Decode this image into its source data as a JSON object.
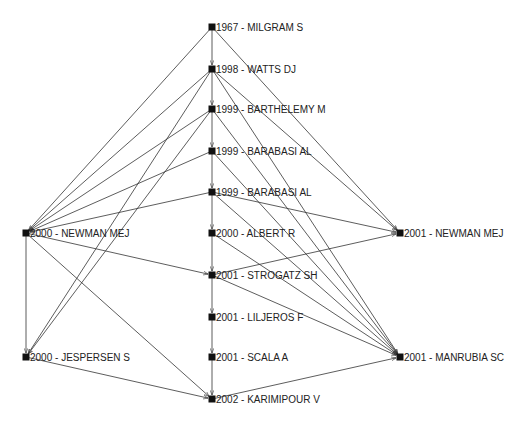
{
  "diagram": {
    "type": "citation-network",
    "colors": {
      "edge": "#333333",
      "node": "#111111",
      "label": "#222222",
      "background": "#ffffff"
    },
    "nodes": [
      {
        "id": "milgram",
        "label": "1967 - MILGRAM S",
        "x": 212,
        "y": 27
      },
      {
        "id": "watts",
        "label": "1998 - WATTS DJ",
        "x": 212,
        "y": 69
      },
      {
        "id": "barthelemy",
        "label": "1999 - BARTHELEMY M",
        "x": 212,
        "y": 109
      },
      {
        "id": "barabasi1",
        "label": "1999 - BARABASI AL",
        "x": 212,
        "y": 151
      },
      {
        "id": "barabasi2",
        "label": "1999 - BARABASI AL",
        "x": 212,
        "y": 192
      },
      {
        "id": "albert",
        "label": "2000 - ALBERT R",
        "x": 212,
        "y": 233
      },
      {
        "id": "strogatz",
        "label": "2001 - STROGATZ SH",
        "x": 212,
        "y": 275
      },
      {
        "id": "liljeros",
        "label": "2001 - LILJEROS F",
        "x": 212,
        "y": 317
      },
      {
        "id": "scala",
        "label": "2001 - SCALA A",
        "x": 212,
        "y": 357
      },
      {
        "id": "karimipour",
        "label": "2002 - KARIMIPOUR V",
        "x": 212,
        "y": 399
      },
      {
        "id": "newman2000",
        "label": "2000 - NEWMAN MEJ",
        "x": 26,
        "y": 233
      },
      {
        "id": "jespersen",
        "label": "2000 - JESPERSEN S",
        "x": 26,
        "y": 357
      },
      {
        "id": "newman2001",
        "label": "2001 - NEWMAN MEJ",
        "x": 400,
        "y": 233
      },
      {
        "id": "manrubia",
        "label": "2001 - MANRUBIA SC",
        "x": 400,
        "y": 357
      }
    ],
    "edges": [
      [
        "milgram",
        "watts"
      ],
      [
        "watts",
        "barthelemy"
      ],
      [
        "barthelemy",
        "barabasi1"
      ],
      [
        "barabasi1",
        "barabasi2"
      ],
      [
        "barabasi2",
        "albert"
      ],
      [
        "albert",
        "strogatz"
      ],
      [
        "strogatz",
        "liljeros"
      ],
      [
        "liljeros",
        "scala"
      ],
      [
        "scala",
        "karimipour"
      ],
      [
        "milgram",
        "newman2000"
      ],
      [
        "milgram",
        "newman2001"
      ],
      [
        "watts",
        "newman2000"
      ],
      [
        "watts",
        "jespersen"
      ],
      [
        "watts",
        "newman2001"
      ],
      [
        "watts",
        "manrubia"
      ],
      [
        "barthelemy",
        "newman2000"
      ],
      [
        "barthelemy",
        "jespersen"
      ],
      [
        "barthelemy",
        "manrubia"
      ],
      [
        "barabasi1",
        "newman2000"
      ],
      [
        "barabasi1",
        "manrubia"
      ],
      [
        "barabasi2",
        "newman2000"
      ],
      [
        "barabasi2",
        "newman2001"
      ],
      [
        "barabasi2",
        "manrubia"
      ],
      [
        "albert",
        "manrubia"
      ],
      [
        "newman2000",
        "strogatz"
      ],
      [
        "newman2000",
        "jespersen"
      ],
      [
        "newman2000",
        "karimipour"
      ],
      [
        "strogatz",
        "newman2001"
      ],
      [
        "strogatz",
        "manrubia"
      ],
      [
        "jespersen",
        "karimipour"
      ],
      [
        "karimipour",
        "manrubia"
      ]
    ]
  }
}
